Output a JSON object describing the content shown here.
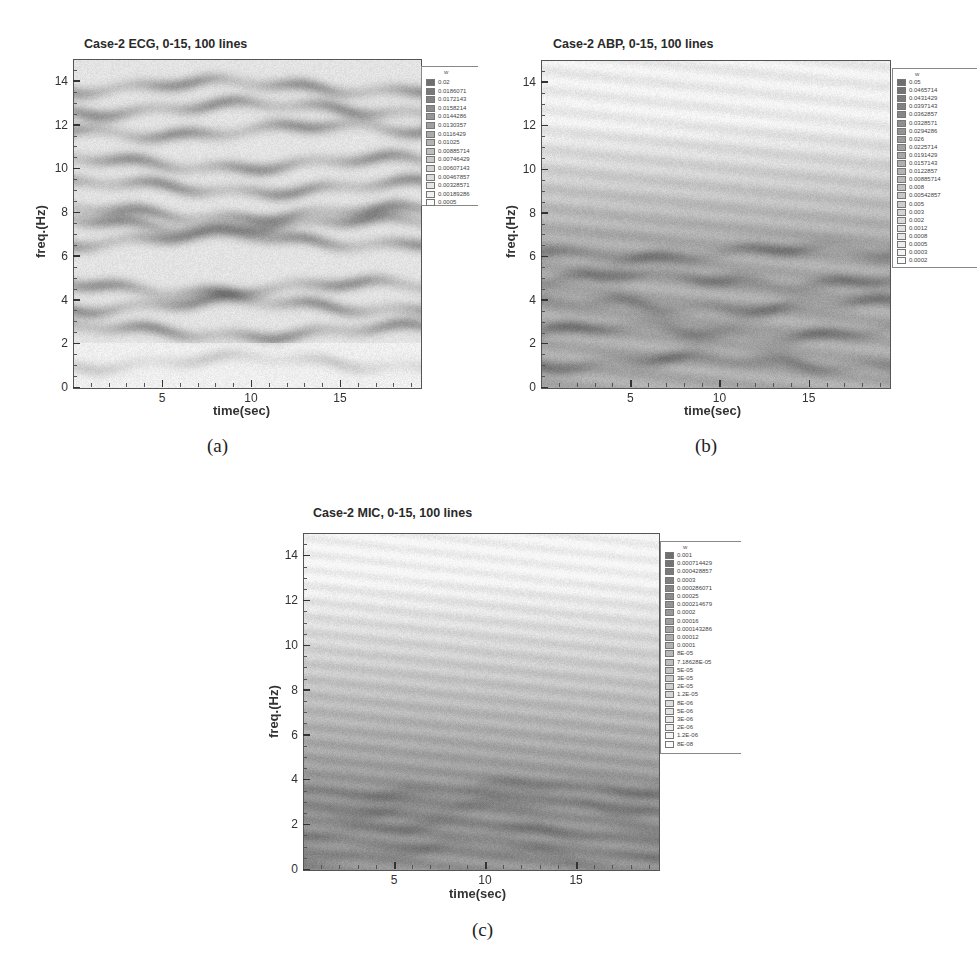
{
  "figure": {
    "panels": [
      {
        "id": "a",
        "title": "Case-2 ECG, 0-15, 100 lines",
        "sublabel": "(a)",
        "xlabel": "time(sec)",
        "ylabel": "freq.(Hz)",
        "legend_header": "w",
        "legend_values": [
          "0.02",
          "0.0186071",
          "0.0172143",
          "0.0158214",
          "0.0144286",
          "0.0130357",
          "0.0116429",
          "0.01025",
          "0.00885714",
          "0.00746429",
          "0.00607143",
          "0.00467857",
          "0.00328571",
          "0.00189286",
          "0.0005"
        ]
      },
      {
        "id": "b",
        "title": "Case-2 ABP, 0-15, 100 lines",
        "sublabel": "(b)",
        "xlabel": "time(sec)",
        "ylabel": "freq.(Hz)",
        "legend_header": "w",
        "legend_values": [
          "0.05",
          "0.0465714",
          "0.0431429",
          "0.0397143",
          "0.0362857",
          "0.0328571",
          "0.0294286",
          "0.026",
          "0.0225714",
          "0.0191429",
          "0.0157143",
          "0.0122857",
          "0.00885714",
          "0.008",
          "0.00542857",
          "0.005",
          "0.003",
          "0.002",
          "0.0012",
          "0.0008",
          "0.0005",
          "0.0003",
          "0.0002"
        ]
      },
      {
        "id": "c",
        "title": "Case-2 MIC, 0-15, 100 lines",
        "sublabel": "(c)",
        "xlabel": "time(sec)",
        "ylabel": "freq.(Hz)",
        "legend_header": "w",
        "legend_values": [
          "0.001",
          "0.000714429",
          "0.000428857",
          "0.0003",
          "0.000286071",
          "0.00025",
          "0.000214679",
          "0.0002",
          "0.00016",
          "0.000143286",
          "0.00012",
          "0.0001",
          "8E-05",
          "7.18628E-05",
          "5E-05",
          "3E-05",
          "2E-05",
          "1.2E-05",
          "8E-06",
          "5E-06",
          "3E-06",
          "2E-06",
          "1.2E-06",
          "8E-08"
        ]
      }
    ]
  },
  "chart_data": [
    {
      "type": "heatmap",
      "title": "Case-2 ECG, 0-15, 100 lines",
      "xlabel": "time(sec)",
      "ylabel": "freq.(Hz)",
      "xlim": [
        0,
        19.5
      ],
      "ylim": [
        0,
        15
      ],
      "xticks": [
        5,
        10,
        15
      ],
      "yticks": [
        0,
        2,
        4,
        6,
        8,
        10,
        12,
        14
      ],
      "colorbar_label": "w",
      "colorbar_range": [
        0.0005,
        0.02
      ],
      "colormap": "grayscale (dark = high)",
      "description": "Horizontal banded energy across all frequencies; strong dark bands near 2.5, 3.8, 4.6, 6.5-8, 10, 12.8, 14 Hz; light region 0-2 Hz with weak band at ~1.2 Hz",
      "dominant_bands_hz": [
        1.2,
        2.6,
        3.8,
        4.6,
        6.8,
        7.5,
        8.0,
        9.2,
        10.3,
        11.8,
        12.8,
        13.8
      ]
    },
    {
      "type": "heatmap",
      "title": "Case-2 ABP, 0-15, 100 lines",
      "xlabel": "time(sec)",
      "ylabel": "freq.(Hz)",
      "xlim": [
        0,
        19.5
      ],
      "ylim": [
        0,
        15
      ],
      "xticks": [
        5,
        10,
        15
      ],
      "yticks": [
        0,
        2,
        4,
        6,
        8,
        10,
        12,
        14
      ],
      "colorbar_label": "w",
      "colorbar_range": [
        0.0002,
        0.05
      ],
      "colormap": "grayscale (dark = high)",
      "description": "Energy concentrated below ~7 Hz with dark bands near 1.2, 2.6, 3.8 Hz; light above 8 Hz with faint bands near 10.5 and 13.5 Hz",
      "dominant_bands_hz": [
        1.2,
        2.6,
        3.8,
        5.0,
        6.2
      ]
    },
    {
      "type": "heatmap",
      "title": "Case-2 MIC, 0-15, 100 lines",
      "xlabel": "time(sec)",
      "ylabel": "freq.(Hz)",
      "xlim": [
        0,
        19.5
      ],
      "ylim": [
        0,
        15
      ],
      "xticks": [
        5,
        10,
        15
      ],
      "yticks": [
        0,
        2,
        4,
        6,
        8,
        10,
        12,
        14
      ],
      "colorbar_label": "w",
      "colorbar_range": [
        8e-08,
        0.001
      ],
      "colormap": "grayscale (dark = high)",
      "description": "Diffuse energy strongest below ~4 Hz, gradually fading toward 12 Hz; very light above 12 Hz",
      "dominant_bands_hz": [
        0.8,
        1.8,
        2.8,
        3.6
      ]
    }
  ]
}
